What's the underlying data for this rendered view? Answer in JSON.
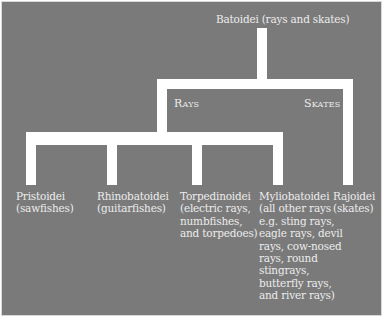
{
  "diagram": {
    "root": {
      "label": "Batoidei (rays and skates)"
    },
    "groups": [
      {
        "label": "Rays"
      },
      {
        "label": "Skates"
      }
    ],
    "leaves": [
      {
        "name": "Pristoidei",
        "desc": "(sawfishes)"
      },
      {
        "name": "Rhinobatoidei",
        "desc": "(guitarfishes)"
      },
      {
        "name": "Torpedinoidei",
        "desc": "(electric rays,\nnumbfishes,\nand torpedoes)"
      },
      {
        "name": "Myliobatoidei",
        "desc": "(all other rays\ne.g. sting rays,\neagle rays, devil\nrays, cow-nosed\nrays, round\nstingrays,\nbutterfly rays,\nand river rays)"
      },
      {
        "name": "Rajoidei",
        "desc": "(skates)"
      }
    ],
    "colors": {
      "background": "#7a7a7a",
      "lines": "#ffffff",
      "text": "#ececec"
    }
  }
}
